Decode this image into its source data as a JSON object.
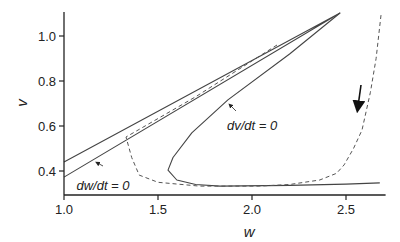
{
  "chart_data": {
    "type": "line",
    "title": "",
    "xlabel": "w",
    "ylabel": "v",
    "xlim": [
      1.0,
      2.7
    ],
    "ylim": [
      0.3,
      1.1
    ],
    "xticks": [
      1.0,
      1.5,
      2.0,
      2.5
    ],
    "xtick_labels": [
      "1.0",
      "1.5",
      "2.0",
      "2.5"
    ],
    "yticks": [
      0.4,
      0.6,
      0.8,
      1.0
    ],
    "ytick_labels": [
      "0.4",
      "0.6",
      "0.8",
      "1.0"
    ],
    "grid": false,
    "legend": null,
    "series": [
      {
        "name": "dw/dt = 0 (nullcline, solid)",
        "style": "solid",
        "points": [
          [
            1.0,
            0.44
          ],
          [
            2.468,
            1.102
          ],
          [
            1.0,
            0.373
          ]
        ]
      },
      {
        "name": "dv/dt = 0 (nullcline, solid)",
        "style": "solid",
        "points": [
          [
            2.468,
            1.102
          ],
          [
            2.2,
            0.92
          ],
          [
            1.872,
            0.716
          ],
          [
            1.68,
            0.57
          ],
          [
            1.58,
            0.46
          ],
          [
            1.553,
            0.404
          ],
          [
            1.6,
            0.36
          ],
          [
            1.7,
            0.34
          ],
          [
            1.83,
            0.333
          ],
          [
            2.2,
            0.336
          ],
          [
            2.5,
            0.342
          ],
          [
            2.68,
            0.347
          ]
        ]
      },
      {
        "name": "trajectory (dashed)",
        "style": "dashed",
        "points": [
          [
            2.133,
            0.96
          ],
          [
            1.7,
            0.73
          ],
          [
            1.4,
            0.585
          ],
          [
            1.33,
            0.551
          ],
          [
            1.36,
            0.46
          ],
          [
            1.4,
            0.382
          ],
          [
            1.5,
            0.35
          ],
          [
            1.72,
            0.333
          ],
          [
            2.04,
            0.333
          ],
          [
            2.2,
            0.34
          ],
          [
            2.36,
            0.36
          ],
          [
            2.45,
            0.39
          ],
          [
            2.49,
            0.427
          ],
          [
            2.54,
            0.5
          ],
          [
            2.585,
            0.582
          ],
          [
            2.63,
            0.75
          ],
          [
            2.66,
            0.9
          ],
          [
            2.686,
            1.093
          ]
        ]
      }
    ],
    "annotations": [
      {
        "text": "dw/dt = 0",
        "x": 1.13,
        "y": 0.37,
        "arrow_to": [
          1.175,
          0.448
        ]
      },
      {
        "text": "dv/dt = 0",
        "x": 1.86,
        "y": 0.58,
        "arrow_to": [
          1.88,
          0.7
        ]
      },
      {
        "text": "direction arrow",
        "x": 2.58,
        "y": 0.79,
        "arrow_to": [
          2.56,
          0.66
        ]
      }
    ]
  }
}
